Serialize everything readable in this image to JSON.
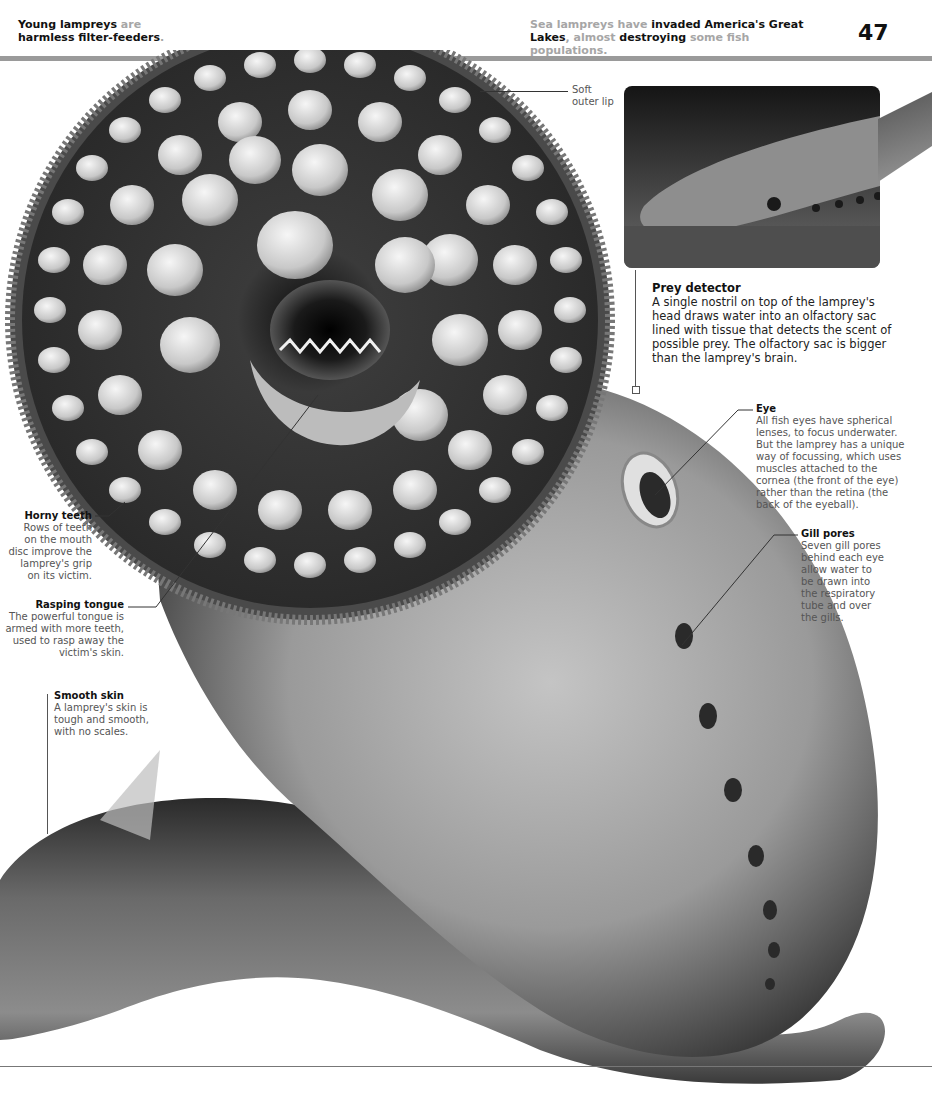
{
  "header": {
    "left_text": [
      {
        "text": "Young lampreys ",
        "style": "dark"
      },
      {
        "text": "are",
        "style": "muted"
      },
      {
        "text": " harmless filter-feeders",
        "style": "dark"
      },
      {
        "text": ".",
        "style": "muted"
      }
    ],
    "left_line1_a": "Young lampreys ",
    "left_line1_b": "are",
    "left_line2_a": "harmless filter-feeders",
    "left_line2_b": ".",
    "right_line1_a": "Sea lampreys have ",
    "right_line1_b": "invaded America's Great",
    "right_line2_a": "Lakes",
    "right_line2_b": ", almost ",
    "right_line2_c": "destroying",
    "right_line2_d": " some fish populations.",
    "page_number": "47"
  },
  "illustration": {
    "subject": "sea-lamprey-mouth-disc",
    "colors": {
      "skin_light": "#b8b8b8",
      "skin_dark": "#3a3a3a",
      "disc_dark": "#2a2a2a",
      "tooth": "#e6e6e6"
    }
  },
  "photo": {
    "subject": "lamprey-head-photo"
  },
  "annotations": {
    "soft_outer_lip": {
      "line1": "Soft",
      "line2": "outer lip"
    },
    "prey_detector": {
      "title": "Prey detector",
      "lines": [
        "A single nostril on top of the lamprey's",
        "head draws water into an olfactory sac",
        "lined with tissue that detects the scent of",
        "possible prey. The olfactory sac is bigger",
        "than the lamprey's brain."
      ]
    },
    "eye": {
      "title": "Eye",
      "lines": [
        "All fish eyes have spherical",
        "lenses, to focus underwater.",
        "But the lamprey has a unique",
        "way of focussing, which uses",
        "muscles attached to the",
        "cornea (the front of the eye)",
        "rather than the retina (the",
        "back of the eyeball)."
      ]
    },
    "gill_pores": {
      "title": "Gill pores",
      "lines": [
        "Seven gill pores",
        "behind each eye",
        "allow water to",
        "be drawn into",
        "the respiratory",
        "tube and over",
        "the gills."
      ]
    },
    "horny_teeth": {
      "title": "Horny teeth",
      "lines": [
        "Rows of teeth",
        "on the mouth",
        "disc improve the",
        "lamprey's grip",
        "on its victim."
      ]
    },
    "rasping_tongue": {
      "title": "Rasping tongue",
      "lines": [
        "The powerful tongue is",
        "armed with more teeth,",
        "used to rasp away the",
        "victim's skin."
      ]
    },
    "smooth_skin": {
      "title": "Smooth skin",
      "lines": [
        "A lamprey's skin is",
        "tough and smooth,",
        "with no scales."
      ]
    }
  }
}
